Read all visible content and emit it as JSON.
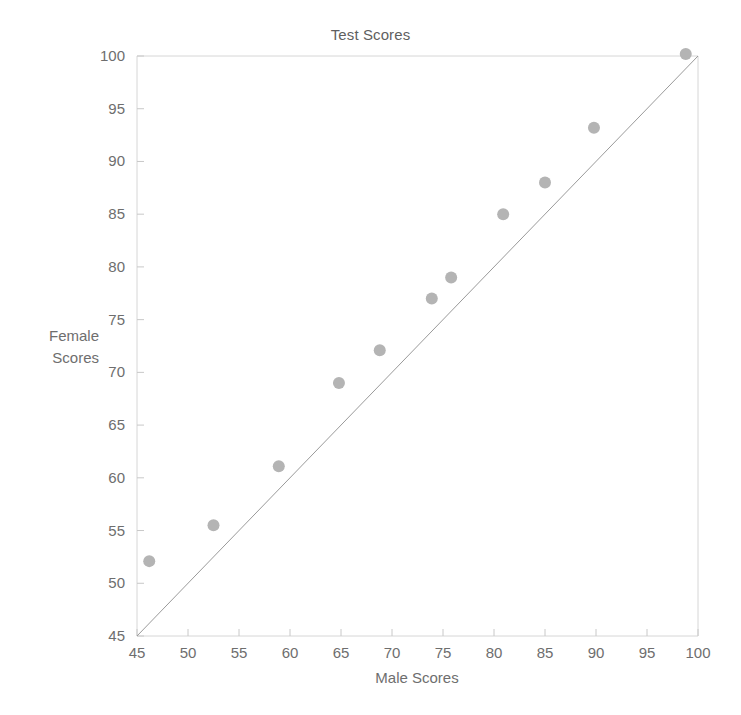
{
  "chart_data": {
    "type": "scatter",
    "title": "Test Scores",
    "xlabel": "Male Scores",
    "ylabel": "Female Scores",
    "ylabel_line1": "Female",
    "ylabel_line2": "Scores",
    "xlim": [
      45,
      100
    ],
    "ylim": [
      45,
      100
    ],
    "xticks": [
      45,
      50,
      55,
      60,
      65,
      70,
      75,
      80,
      85,
      90,
      95,
      100
    ],
    "yticks": [
      45,
      50,
      55,
      60,
      65,
      70,
      75,
      80,
      85,
      90,
      95,
      100
    ],
    "xtick_labels": [
      "45",
      "50",
      "55",
      "60",
      "65",
      "70",
      "75",
      "80",
      "85",
      "90",
      "95",
      "100"
    ],
    "ytick_labels": [
      "45",
      "50",
      "55",
      "60",
      "65",
      "70",
      "75",
      "80",
      "85",
      "90",
      "95",
      "100"
    ],
    "grid": false,
    "legend": null,
    "marker_color": "#b4b4b4",
    "marker_radius": 6,
    "reference_line": {
      "name": "y = x identity line",
      "color": "#9a9a9a",
      "from": [
        45,
        45
      ],
      "to": [
        100,
        100
      ]
    },
    "series": [
      {
        "name": "Scores",
        "points": [
          {
            "x": 46.2,
            "y": 52.1
          },
          {
            "x": 52.5,
            "y": 55.5
          },
          {
            "x": 58.9,
            "y": 61.1
          },
          {
            "x": 64.8,
            "y": 69.0
          },
          {
            "x": 68.8,
            "y": 72.1
          },
          {
            "x": 73.9,
            "y": 77.0
          },
          {
            "x": 75.8,
            "y": 79.0
          },
          {
            "x": 80.9,
            "y": 85.0
          },
          {
            "x": 85.0,
            "y": 88.0
          },
          {
            "x": 89.8,
            "y": 93.2
          },
          {
            "x": 98.8,
            "y": 100.2
          }
        ]
      }
    ]
  },
  "plot_geometry": {
    "left": 137,
    "right": 698,
    "top": 56,
    "bottom": 636
  }
}
